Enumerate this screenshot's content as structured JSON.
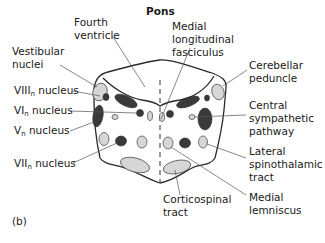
{
  "title": "Pons",
  "panel_label": "(b)",
  "labels": {
    "fourth_ventricle": [
      "Fourth",
      "ventricle"
    ],
    "vestibular_nuclei": [
      "Vestibular",
      "nuclei"
    ],
    "viii_nucleus": {
      "main": "VIII",
      "sub": "n",
      "rest": " nucleus"
    },
    "vi_nucleus": {
      "main": "VI",
      "sub": "n",
      "rest": " nucleus"
    },
    "v_nucleus": {
      "main": "V",
      "sub": "n",
      "rest": " nucleus"
    },
    "vii_nucleus": {
      "main": "VII",
      "sub": "n",
      "rest": " nucleus"
    },
    "medial_longitudinal_fasciculus": [
      "Medial",
      "longitudinal",
      "fasciculus"
    ],
    "cerebellar_peduncle": [
      "Cerebellar",
      "peduncle"
    ],
    "central_sympathetic_pathway": [
      "Central",
      "sympathetic",
      "pathway"
    ],
    "lateral_spinothalamic_tract": [
      "Lateral",
      "spinothalamic",
      "tract"
    ],
    "medial_lemniscus": [
      "Medial",
      "lemniscus"
    ],
    "corticospinal_tract": [
      "Corticospinal",
      "tract"
    ]
  }
}
